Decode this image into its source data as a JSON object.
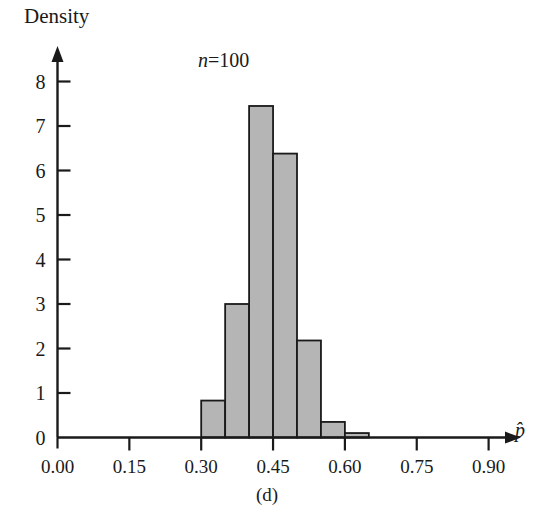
{
  "figure": {
    "caption": "(d)",
    "annotation_n": "n",
    "annotation_eq": "=",
    "annotation_value": "100",
    "ylabel": "Density",
    "xlabel": "p̂"
  },
  "chart_data": {
    "type": "bar",
    "title": "",
    "subtitle": "n = 100",
    "xlabel": "p̂",
    "ylabel": "Density",
    "xlim": [
      0.0,
      1.0
    ],
    "ylim": [
      0,
      8.6
    ],
    "grid": false,
    "legend": "none",
    "bin_width": 0.05,
    "bin_edges": [
      0.3,
      0.35,
      0.4,
      0.45,
      0.5,
      0.55,
      0.6,
      0.65
    ],
    "categories": [
      "0.30-0.35",
      "0.35-0.40",
      "0.40-0.45",
      "0.45-0.50",
      "0.50-0.55",
      "0.55-0.60",
      "0.60-0.65"
    ],
    "values": [
      0.83,
      3.0,
      7.45,
      6.38,
      2.18,
      0.35,
      0.1
    ],
    "bar_fill_color": "#b5b5b5",
    "bar_edge_color": "#1a1a1a",
    "xticks": [
      0.0,
      0.15,
      0.3,
      0.45,
      0.6,
      0.75,
      0.9
    ],
    "xtick_labels": [
      "0.00",
      "0.15",
      "0.30",
      "0.45",
      "0.60",
      "0.75",
      "0.90"
    ],
    "yticks": [
      0,
      1,
      2,
      3,
      4,
      5,
      6,
      7,
      8
    ],
    "ytick_labels": [
      "0",
      "1",
      "2",
      "3",
      "4",
      "5",
      "6",
      "7",
      "8"
    ]
  }
}
